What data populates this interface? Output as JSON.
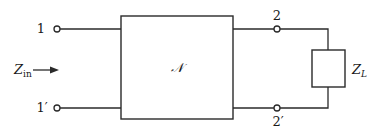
{
  "diagram": {
    "type": "two-port network circuit",
    "network": {
      "label": "𝒩"
    },
    "terminals": {
      "port1_top": "1",
      "port1_bottom": "1′",
      "port2_top": "2",
      "port2_bottom": "2′"
    },
    "input_impedance": {
      "symbol": "Z",
      "subscript": "in"
    },
    "load": {
      "symbol": "Z",
      "subscript": "L"
    },
    "colors": {
      "stroke": "#2a2a2a",
      "background": "#ffffff"
    }
  }
}
